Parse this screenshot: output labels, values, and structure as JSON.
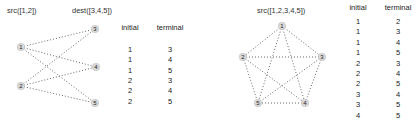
{
  "left": {
    "src_label": "src([1,2])",
    "dest_label": "dest([3,4,5])",
    "nodes": [
      {
        "id": "1",
        "x": 21,
        "y": 47
      },
      {
        "id": "2",
        "x": 21,
        "y": 86
      },
      {
        "id": "3",
        "x": 95,
        "y": 29
      },
      {
        "id": "4",
        "x": 96,
        "y": 67
      },
      {
        "id": "5",
        "x": 95,
        "y": 103
      }
    ],
    "edges": [
      [
        "1",
        "3"
      ],
      [
        "1",
        "4"
      ],
      [
        "1",
        "5"
      ],
      [
        "2",
        "3"
      ],
      [
        "2",
        "4"
      ],
      [
        "2",
        "5"
      ]
    ],
    "table": {
      "headers": [
        "initial",
        "terminal"
      ],
      "rows": [
        [
          "1",
          "3"
        ],
        [
          "1",
          "4"
        ],
        [
          "1",
          "5"
        ],
        [
          "2",
          "3"
        ],
        [
          "2",
          "4"
        ],
        [
          "2",
          "5"
        ]
      ]
    }
  },
  "right": {
    "src_label": "src([1,2,3,4,5])",
    "nodes": [
      {
        "id": "1",
        "x": 282,
        "y": 26
      },
      {
        "id": "2",
        "x": 243,
        "y": 57
      },
      {
        "id": "3",
        "x": 322,
        "y": 57
      },
      {
        "id": "4",
        "x": 305,
        "y": 103
      },
      {
        "id": "5",
        "x": 258,
        "y": 103
      }
    ],
    "edges": [
      [
        "1",
        "2"
      ],
      [
        "1",
        "3"
      ],
      [
        "1",
        "4"
      ],
      [
        "1",
        "5"
      ],
      [
        "2",
        "3"
      ],
      [
        "2",
        "4"
      ],
      [
        "2",
        "5"
      ],
      [
        "3",
        "4"
      ],
      [
        "3",
        "5"
      ],
      [
        "4",
        "5"
      ]
    ],
    "table": {
      "headers": [
        "initial",
        "terminal"
      ],
      "rows": [
        [
          "1",
          "2"
        ],
        [
          "1",
          "3"
        ],
        [
          "1",
          "4"
        ],
        [
          "1",
          "5"
        ],
        [
          "2",
          "3"
        ],
        [
          "2",
          "4"
        ],
        [
          "2",
          "5"
        ],
        [
          "3",
          "4"
        ],
        [
          "3",
          "5"
        ],
        [
          "4",
          "5"
        ]
      ]
    }
  },
  "style": {
    "node_fill": "#d9d9d9",
    "edge_color": "#555555",
    "text_color": "#222222"
  }
}
